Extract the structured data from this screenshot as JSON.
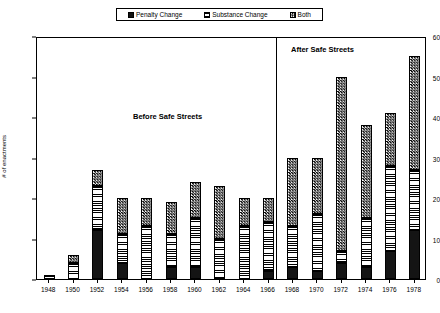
{
  "legend": {
    "position": "top-center",
    "items": [
      {
        "label": "Penalty Change",
        "icon": "legend-swatch-solid-black",
        "pattern": "solid"
      },
      {
        "label": "Substance Change",
        "icon": "legend-swatch-horizontal-lines",
        "pattern": "hlines"
      },
      {
        "label": "Both",
        "icon": "legend-swatch-checkered",
        "pattern": "checker"
      }
    ]
  },
  "annotations": [
    {
      "text": "Before Safe Streets"
    },
    {
      "text": "After Safe Streets"
    }
  ],
  "axes": {
    "y_title": "# of enactments",
    "y_ticks": [
      "0",
      "10",
      "20",
      "30",
      "40",
      "50",
      "60"
    ],
    "x_ticks": [
      "1948",
      "1950",
      "1952",
      "1954",
      "1956",
      "1958",
      "1960",
      "1962",
      "1964",
      "1966",
      "1968",
      "1970",
      "1972",
      "1974",
      "1976",
      "1978"
    ]
  },
  "chart_data": {
    "type": "bar",
    "stacked": true,
    "title": "",
    "xlabel": "",
    "ylabel": "# of enactments",
    "ylim": [
      0,
      60
    ],
    "ytick_step": 10,
    "grid": false,
    "legend_position": "top-center",
    "categories": [
      "1948",
      "1950",
      "1952",
      "1954",
      "1956",
      "1958",
      "1960",
      "1962",
      "1964",
      "1966",
      "1968",
      "1970",
      "1972",
      "1974",
      "1976",
      "1978"
    ],
    "series": [
      {
        "name": "Penalty Change",
        "pattern": "solid",
        "values": [
          0,
          0,
          12,
          4,
          0,
          3,
          3,
          0,
          0,
          2,
          3,
          2,
          4,
          3,
          7,
          12
        ]
      },
      {
        "name": "Substance Change",
        "pattern": "hlines",
        "values": [
          1,
          4,
          11,
          7,
          13,
          8,
          12,
          10,
          13,
          12,
          10,
          14,
          3,
          12,
          21,
          15
        ]
      },
      {
        "name": "Both",
        "pattern": "checker",
        "values": [
          0,
          2,
          4,
          9,
          7,
          8,
          9,
          13,
          7,
          6,
          17,
          14,
          43,
          23,
          13,
          28
        ]
      }
    ],
    "totals": [
      1,
      6,
      27,
      20,
      20,
      19,
      24,
      23,
      20,
      20,
      30,
      30,
      50,
      38,
      41,
      55
    ],
    "divider": {
      "after_category": "1966",
      "label_left": "Before Safe Streets",
      "label_right": "After Safe Streets"
    }
  },
  "colors": {
    "axis": "#000000",
    "background": "#ffffff",
    "penalty": "#141414",
    "substance": "#000000",
    "both": "#000000"
  }
}
